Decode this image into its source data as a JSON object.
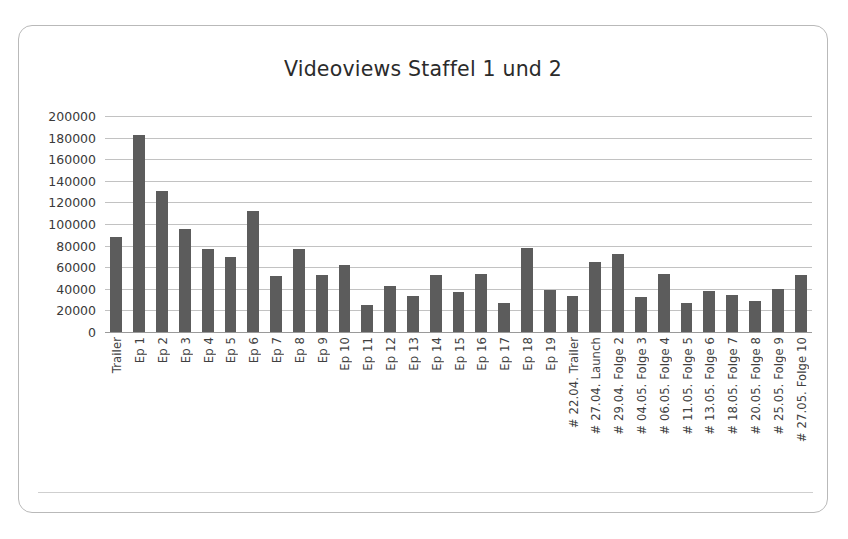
{
  "chart_data": {
    "type": "bar",
    "title": "Videoviews Staffel 1 und 2",
    "xlabel": "",
    "ylabel": "",
    "ylim": [
      0,
      200000
    ],
    "ytick_step": 20000,
    "yticks": [
      "200000",
      "180000",
      "160000",
      "140000",
      "120000",
      "100000",
      "80000",
      "60000",
      "40000",
      "20000",
      "0"
    ],
    "grid": true,
    "legend": false,
    "bar_color": "#5c5c5c",
    "categories": [
      "Trailer",
      "Ep 1",
      "Ep 2",
      "Ep 3",
      "Ep 4",
      "Ep 5",
      "Ep 6",
      "Ep 7",
      "Ep 8",
      "Ep 9",
      "Ep 10",
      "Ep 11",
      "Ep 12",
      "Ep 13",
      "Ep 14",
      "Ep 15",
      "Ep 16",
      "Ep 17",
      "Ep 18",
      "Ep 19",
      "# 22.04. Trailer",
      "# 27.04. Launch",
      "# 29.04. Folge 2",
      "# 04.05. Folge 3",
      "# 06.05. Folge 4",
      "# 11.05. Folge 5",
      "# 13.05. Folge 6",
      "# 18.05. Folge 7",
      "# 20.05. Folge 8",
      "# 25.05. Folge 9",
      "# 27.05. Folge 10"
    ],
    "values": [
      88000,
      182000,
      131000,
      95000,
      77000,
      69000,
      112000,
      52000,
      77000,
      53000,
      62000,
      25000,
      43000,
      33000,
      53000,
      37000,
      54000,
      27000,
      78000,
      39000,
      33000,
      65000,
      72000,
      32000,
      54000,
      27000,
      38000,
      34000,
      29000,
      40000,
      53000
    ]
  },
  "page": {
    "title": "Videoviews Staffel 1 und 2"
  }
}
